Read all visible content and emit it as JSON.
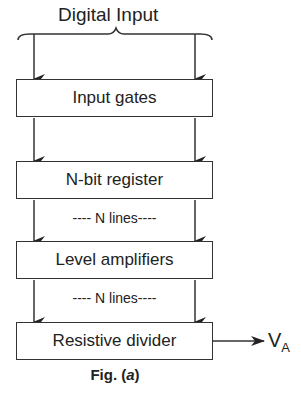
{
  "diagram": {
    "input_label": "Digital Input",
    "blocks": [
      {
        "label": "Input gates"
      },
      {
        "label": "N-bit register"
      },
      {
        "label": "Level amplifiers"
      },
      {
        "label": "Resistive divider"
      }
    ],
    "connector_labels": [
      "---- N lines----",
      "---- N lines----"
    ],
    "output_label": "V",
    "output_subscript": "A",
    "caption_prefix": "Fig. (",
    "caption_letter": "a",
    "caption_suffix": ")"
  }
}
